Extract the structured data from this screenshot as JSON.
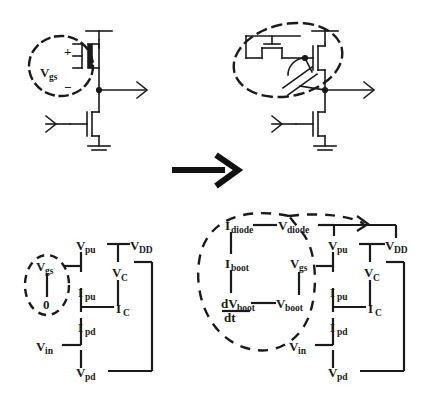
{
  "figure": {
    "colors": {
      "ink": "#1a1a1a",
      "background": "#ffffff",
      "dashed": "#1a1a1a"
    },
    "transition_arrow": {
      "name": "right-arrow",
      "direction": "right"
    }
  },
  "panels": {
    "top_left": {
      "name": "original-circuit",
      "highlight": {
        "shape": "dashed-ellipse",
        "encloses": "gate-source-voltage"
      },
      "labels": {
        "plus": "+",
        "minus": "−",
        "vgs": "V",
        "vgs_sub": "gs"
      },
      "devices": [
        "pull-up-transistor",
        "pull-down-transistor",
        "ground"
      ],
      "ports": [
        "input-arrow",
        "output-arrow"
      ]
    },
    "top_right": {
      "name": "bootstrapped-circuit",
      "highlight": {
        "shape": "dashed-ellipse",
        "encloses": "bootstrap-network"
      },
      "devices": [
        "diode-connected-transistor",
        "bootstrap-capacitor",
        "pull-up-transistor",
        "pull-down-transistor",
        "ground"
      ],
      "ports": [
        "input-arrow",
        "output-arrow"
      ]
    },
    "bottom_left": {
      "name": "original-signal-flow-graph",
      "highlight": {
        "shape": "dashed-ellipse",
        "encloses": "vgs-constant-branch"
      },
      "nodes": [
        {
          "id": "vgs",
          "base": "V",
          "sub": "gs",
          "x": 46,
          "y": 267
        },
        {
          "id": "zero",
          "base": "0",
          "sub": "",
          "x": 49,
          "y": 305
        },
        {
          "id": "vpu",
          "base": "V",
          "sub": "pu",
          "x": 85,
          "y": 248
        },
        {
          "id": "vdd",
          "base": "V",
          "sub": "DD",
          "x": 135,
          "y": 248
        },
        {
          "id": "vc",
          "base": "V",
          "sub": "C",
          "x": 120,
          "y": 275
        },
        {
          "id": "ipu",
          "base": "I",
          "sub": "pu",
          "x": 85,
          "y": 295
        },
        {
          "id": "ic",
          "base": "I",
          "sub": "C",
          "x": 121,
          "y": 311
        },
        {
          "id": "ipd",
          "base": "I",
          "sub": "pd",
          "x": 85,
          "y": 330
        },
        {
          "id": "vin",
          "base": "V",
          "sub": "in",
          "x": 43,
          "y": 349
        },
        {
          "id": "vpd",
          "base": "V",
          "sub": "pd",
          "x": 85,
          "y": 375
        }
      ]
    },
    "bottom_right": {
      "name": "bootstrapped-signal-flow-graph",
      "highlight": {
        "shape": "dashed-ellipse",
        "encloses": "bootstrap-feedback-loop"
      },
      "nodes": [
        {
          "id": "idiode",
          "base": "I",
          "sub": "diode",
          "x": 228,
          "y": 228
        },
        {
          "id": "vdiode",
          "base": "V",
          "sub": "diode",
          "x": 285,
          "y": 228
        },
        {
          "id": "iboot",
          "base": "I",
          "sub": "boot",
          "x": 228,
          "y": 266
        },
        {
          "id": "vgs",
          "base": "V",
          "sub": "gs",
          "x": 295,
          "y": 266
        },
        {
          "id": "dvbootdt",
          "base": "dV",
          "sub": "boot",
          "x": 224,
          "y": 305
        },
        {
          "id": "dt",
          "base": "dt",
          "sub": "",
          "x": 228,
          "y": 318
        },
        {
          "id": "vboot",
          "base": "V",
          "sub": "boot",
          "x": 283,
          "y": 305
        },
        {
          "id": "vpu",
          "base": "V",
          "sub": "pu",
          "x": 337,
          "y": 248
        },
        {
          "id": "vdd",
          "base": "V",
          "sub": "DD",
          "x": 390,
          "y": 248
        },
        {
          "id": "vc",
          "base": "V",
          "sub": "C",
          "x": 372,
          "y": 275
        },
        {
          "id": "ipu",
          "base": "I",
          "sub": "pu",
          "x": 337,
          "y": 295
        },
        {
          "id": "ic",
          "base": "I",
          "sub": "C",
          "x": 373,
          "y": 311
        },
        {
          "id": "ipd",
          "base": "I",
          "sub": "pd",
          "x": 337,
          "y": 330
        },
        {
          "id": "vin",
          "base": "V",
          "sub": "in",
          "x": 296,
          "y": 349
        },
        {
          "id": "vpd",
          "base": "V",
          "sub": "pd",
          "x": 337,
          "y": 375
        }
      ]
    }
  }
}
